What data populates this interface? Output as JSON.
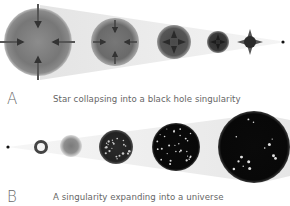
{
  "panels": [
    {
      "id": "A",
      "letter": "A",
      "caption": "Star collapsing into a black hole singularity",
      "stages": [
        {
          "name": "large-star",
          "description": "star with inward arrows"
        },
        {
          "name": "medium-star",
          "description": "shrinking star with inward arrows"
        },
        {
          "name": "smaller-star",
          "description": "denser star"
        },
        {
          "name": "compact-star",
          "description": "very dense star"
        },
        {
          "name": "star-collapsing-point",
          "description": "star with spiky collapse"
        },
        {
          "name": "singularity",
          "description": "black hole singularity point"
        }
      ]
    },
    {
      "id": "B",
      "letter": "B",
      "caption": "A singularity expanding into a universe",
      "stages": [
        {
          "name": "singularity",
          "description": "initial singularity point"
        },
        {
          "name": "ring",
          "description": "small expanding ring"
        },
        {
          "name": "hazy-sphere",
          "description": "hazy gray sphere"
        },
        {
          "name": "early-universe",
          "description": "dark sphere with many bright spots"
        },
        {
          "name": "universe-with-galaxies",
          "description": "black sphere with bright galaxies"
        },
        {
          "name": "large-universe",
          "description": "large black sphere with sparse galaxies"
        }
      ]
    }
  ],
  "colors": {
    "background": "#ffffff",
    "cone": "#ececec",
    "star": "#6f6f6f",
    "universe": "#111111",
    "text": "#666666"
  }
}
